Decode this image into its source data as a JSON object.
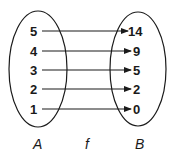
{
  "diagram": {
    "type": "mapping-diagram",
    "domain_label": "A",
    "function_label": "f",
    "codomain_label": "B",
    "domain_values": [
      "5",
      "4",
      "3",
      "2",
      "1"
    ],
    "codomain_values": [
      "14",
      "9",
      "5",
      "2",
      "0"
    ],
    "mappings": [
      {
        "from": "5",
        "to": "14"
      },
      {
        "from": "4",
        "to": "9"
      },
      {
        "from": "3",
        "to": "5"
      },
      {
        "from": "2",
        "to": "2"
      },
      {
        "from": "1",
        "to": "0"
      }
    ],
    "colors": {
      "stroke": "#1a1a1a",
      "background": "#ffffff"
    }
  }
}
